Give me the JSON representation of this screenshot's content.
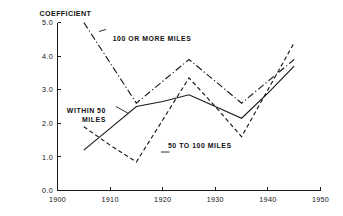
{
  "chart_data": {
    "type": "line",
    "title": "",
    "xlabel": "",
    "ylabel": "COEFFICIENT",
    "xlim": [
      1900,
      1950
    ],
    "ylim": [
      0.0,
      5.0
    ],
    "grid": false,
    "legend_position": "inline-annotations",
    "x": [
      1905,
      1910,
      1915,
      1920,
      1925,
      1930,
      1935,
      1940,
      1945
    ],
    "xticks": [
      "1900",
      "1910",
      "1920",
      "1930",
      "1940",
      "1950"
    ],
    "xtick_values": [
      1900,
      1910,
      1920,
      1930,
      1940,
      1950
    ],
    "yticks": [
      "0.0",
      "1.0",
      "2.0",
      "3.0",
      "4.0",
      "5.0"
    ],
    "ytick_values": [
      0.0,
      1.0,
      2.0,
      3.0,
      4.0,
      5.0
    ],
    "series": [
      {
        "name": "100 OR MORE MILES",
        "style": "dashdot",
        "values": [
          5.0,
          3.8,
          2.6,
          3.25,
          3.9,
          3.25,
          2.6,
          3.25,
          3.9
        ]
      },
      {
        "name": "WITHIN 50 MILES",
        "style": "solid",
        "values": [
          1.2,
          1.85,
          2.5,
          2.65,
          2.85,
          2.5,
          2.15,
          2.9,
          3.7
        ]
      },
      {
        "name": "50 TO 100 MILES",
        "style": "dashed",
        "values": [
          1.9,
          1.35,
          0.85,
          2.1,
          3.35,
          2.5,
          1.6,
          3.0,
          4.4
        ]
      }
    ],
    "annotations": [
      {
        "text": "100 OR MORE MILES",
        "x": 1910.5,
        "y": 4.45
      },
      {
        "text": "WITHIN 50",
        "x": 1909.2,
        "y": 2.32
      },
      {
        "text": "MILES",
        "x": 1909.2,
        "y": 2.03
      },
      {
        "text": "50 TO 100 MILES",
        "x": 1921.0,
        "y": 1.26
      }
    ]
  },
  "axis": {
    "y_title": "COEFFICIENT"
  }
}
